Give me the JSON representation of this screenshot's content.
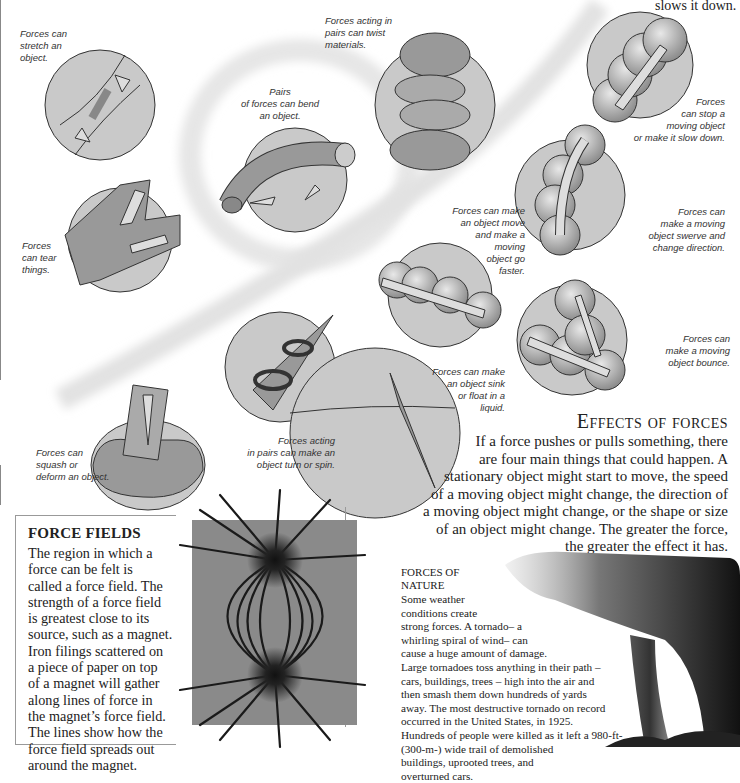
{
  "top_fragment": "slows it down.",
  "captions": {
    "stretch": [
      "Forces can",
      "stretch an",
      "object."
    ],
    "twist": [
      "Forces acting in",
      "pairs can twist",
      "materials."
    ],
    "bend": [
      "Pairs",
      "of forces can bend",
      "an object."
    ],
    "stop": [
      "Forces",
      "can stop a",
      "moving object",
      "or make it slow down."
    ],
    "tear": [
      "Forces",
      "can tear",
      "things."
    ],
    "faster": [
      "Forces can make",
      "an object move",
      "and make a",
      "moving",
      "object go",
      "faster."
    ],
    "swerve": [
      "Forces can",
      "make a moving",
      "object swerve and",
      "change direction."
    ],
    "bounce": [
      "Forces can",
      "make a moving",
      "object bounce."
    ],
    "sink": [
      "Forces can make",
      "an object sink",
      "or float in a",
      "liquid."
    ],
    "spin": [
      "Forces acting",
      "in pairs can make an",
      "object turn or spin."
    ],
    "squash": [
      "Forces can",
      "squash or",
      "deform an object."
    ]
  },
  "effects": {
    "title": "Effects of forces",
    "lines": [
      "If a force pushes or pulls something, there",
      "are four main things that could happen. A",
      "stationary object might start to move, the speed",
      "of a moving object might change, the direction of",
      "a moving object might change, or the shape or size",
      "of an object might change. The greater the force,",
      "the greater the effect it has."
    ]
  },
  "force_fields": {
    "title": "FORCE FIELDS",
    "lines": [
      "The region in which a",
      "force can be felt is",
      "called a force field. The",
      "strength of a force field",
      "is greatest close to its",
      "source, such as a magnet.",
      "Iron filings scattered on",
      "a piece of paper on top",
      "of a magnet will gather",
      "along lines of force in",
      "the magnet’s force field.",
      "The lines show how the",
      "force field spreads out",
      "around the magnet."
    ]
  },
  "forces_of_nature": {
    "title_lines": [
      "FORCES OF",
      "NATURE"
    ],
    "lines": [
      "Some weather",
      "conditions create",
      "strong forces. A tornado– a",
      "whirling spiral of wind– can",
      "cause a huge amount of damage.",
      "Large tornadoes toss anything in their path –",
      "cars, buildings, trees – high into the air and",
      "then smash them down hundreds of yards",
      "away. The most destructive tornado on record",
      "occurred in the United States, in 1925.",
      "Hundreds of people were killed as it left a 980-ft-",
      "(300-m-) wide trail of demolished",
      "buildings, uprooted trees, and",
      "overturned cars."
    ]
  },
  "colors": {
    "circle_fill": "#c9c9c9",
    "object_fill": "#9a9a9a",
    "arrow_fill": "#dcdcdc",
    "outline": "#333333",
    "caption": "#333333"
  }
}
